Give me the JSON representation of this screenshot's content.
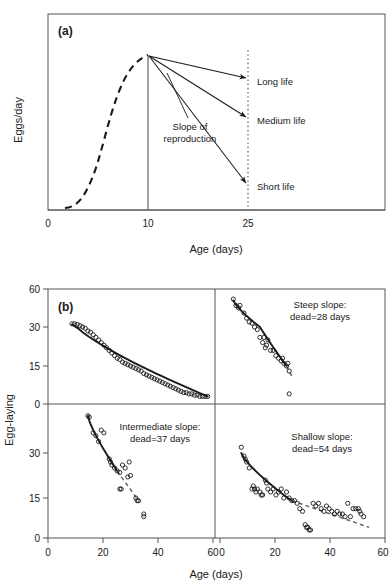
{
  "figure": {
    "panels": [
      {
        "id": "a",
        "letter": "(a)",
        "xlabel": "Age (days)",
        "ylabel": "Eggs/day",
        "xticks": [
          "0",
          "10",
          "25"
        ],
        "annotations": [
          "Long life",
          "Medium life",
          "Short life",
          "Slope of",
          "reproduction"
        ]
      },
      {
        "id": "b",
        "letter": "(b)",
        "xlabel": "Age (days)",
        "ylabel": "Egg-laying",
        "yticks_upper": [
          "60",
          "30",
          "15",
          "0"
        ],
        "yticks_lower": [
          "30",
          "15",
          "0"
        ],
        "xticks_left": [
          "0",
          "20",
          "40",
          "60"
        ],
        "xticks_right": [
          "0",
          "20",
          "40",
          "60"
        ],
        "subpanels": [
          {
            "key": "top_left",
            "line1": "",
            "line2": ""
          },
          {
            "key": "top_right",
            "line1": "Steep slope:",
            "line2": "dead=28 days"
          },
          {
            "key": "bottom_left",
            "line1": "Intermediate slope:",
            "line2": "dead=37 days"
          },
          {
            "key": "bottom_right",
            "line1": "Shallow slope:",
            "line2": "dead=54 days"
          }
        ]
      }
    ]
  },
  "colors": {
    "ink": "#1a1a1a",
    "axis": "#555555",
    "marker_stroke": "#1a1a1a",
    "background": "#ffffff"
  },
  "chart_data": [
    {
      "type": "line",
      "panel": "a",
      "title": "",
      "xlabel": "Age (days)",
      "ylabel": "Eggs/day",
      "xticks": [
        0,
        10,
        25
      ],
      "xlim": [
        0,
        35
      ],
      "ylim": [
        0,
        1
      ],
      "grid": false,
      "legend": "none",
      "series": [
        {
          "name": "rise-to-peak (dashed)",
          "style": "dashed",
          "x": [
            2.0,
            2.8,
            3.6,
            4.4,
            5.2,
            6.0,
            6.8,
            7.6,
            8.4,
            9.2,
            10.0
          ],
          "y": [
            0.02,
            0.05,
            0.1,
            0.18,
            0.3,
            0.45,
            0.62,
            0.78,
            0.9,
            0.97,
            1.0
          ]
        },
        {
          "name": "Long life (slope)",
          "style": "solid-arrow",
          "x": [
            10,
            25
          ],
          "y": [
            1.0,
            0.8
          ]
        },
        {
          "name": "Medium life (slope)",
          "style": "solid-arrow",
          "x": [
            10,
            25
          ],
          "y": [
            1.0,
            0.56
          ]
        },
        {
          "name": "Short life (slope)",
          "style": "solid-arrow",
          "x": [
            10,
            25
          ],
          "y": [
            1.0,
            0.16
          ]
        }
      ],
      "annotations": [
        {
          "text": "Long life",
          "x": 26,
          "y": 0.8
        },
        {
          "text": "Medium life",
          "x": 26,
          "y": 0.56
        },
        {
          "text": "Short life",
          "x": 26,
          "y": 0.16
        },
        {
          "text": "Slope of reproduction",
          "x": 15,
          "y": 0.44
        }
      ],
      "reference_lines": [
        {
          "x": 10,
          "style": "solid"
        },
        {
          "x": 25,
          "style": "dotted"
        }
      ]
    },
    {
      "type": "scatter",
      "panel": "b.top_left",
      "label": "(b)",
      "xlabel": "Age (days)",
      "ylabel": "Egg-laying",
      "xlim": [
        0,
        62
      ],
      "ylim": [
        0,
        60
      ],
      "xticks": [
        0,
        20,
        40,
        60
      ],
      "yticks": [
        0,
        15,
        30,
        60
      ],
      "grid": false,
      "points": [
        [
          9,
          32.5
        ],
        [
          10,
          32.5
        ],
        [
          11,
          32
        ],
        [
          12,
          31
        ],
        [
          13,
          30
        ],
        [
          14,
          29.5
        ],
        [
          15,
          28.5
        ],
        [
          16,
          28
        ],
        [
          17,
          27
        ],
        [
          18,
          26
        ],
        [
          19,
          25
        ],
        [
          20,
          24
        ],
        [
          21,
          23
        ],
        [
          22,
          22
        ],
        [
          23,
          21
        ],
        [
          24,
          20
        ],
        [
          25,
          19
        ],
        [
          26,
          18
        ],
        [
          27,
          17.5
        ],
        [
          28,
          16.5
        ],
        [
          29,
          16
        ],
        [
          30,
          15.5
        ],
        [
          31,
          15
        ],
        [
          32,
          14.5
        ],
        [
          33,
          14
        ],
        [
          34,
          13.5
        ],
        [
          35,
          13
        ],
        [
          36,
          12
        ],
        [
          37,
          11.5
        ],
        [
          38,
          11
        ],
        [
          39,
          10.5
        ],
        [
          40,
          10
        ],
        [
          41,
          9.5
        ],
        [
          42,
          9
        ],
        [
          43,
          8.5
        ],
        [
          44,
          8
        ],
        [
          45,
          7.5
        ],
        [
          46,
          7
        ],
        [
          47,
          6.5
        ],
        [
          48,
          6
        ],
        [
          49,
          5.5
        ],
        [
          50,
          5
        ],
        [
          51,
          4.5
        ],
        [
          52,
          4.5
        ],
        [
          53,
          4
        ],
        [
          54,
          4
        ],
        [
          55,
          3.5
        ],
        [
          56,
          3.5
        ],
        [
          57,
          3
        ],
        [
          58,
          3
        ],
        [
          59,
          3
        ],
        [
          60,
          3
        ]
      ],
      "fit_line": {
        "style": "solid",
        "x": [
          9,
          60
        ],
        "y": [
          32,
          3
        ]
      }
    },
    {
      "type": "scatter",
      "panel": "b.top_right",
      "label": "Steep slope: dead=28 days",
      "xlabel": "Age (days)",
      "ylabel": "Egg-laying",
      "xlim": [
        0,
        62
      ],
      "ylim": [
        0,
        60
      ],
      "xticks": [
        0,
        20,
        40,
        60
      ],
      "yticks": [
        0,
        15,
        30,
        60
      ],
      "grid": false,
      "points": [
        [
          5,
          52
        ],
        [
          6,
          47
        ],
        [
          7,
          45
        ],
        [
          7.5,
          47
        ],
        [
          9,
          41
        ],
        [
          10,
          37
        ],
        [
          11,
          34
        ],
        [
          12,
          33
        ],
        [
          13,
          30
        ],
        [
          14,
          29
        ],
        [
          15,
          26
        ],
        [
          16,
          24
        ],
        [
          16.5,
          26
        ],
        [
          17,
          22
        ],
        [
          17.5,
          23
        ],
        [
          18,
          25
        ],
        [
          19,
          21
        ],
        [
          20,
          21
        ],
        [
          21,
          19
        ],
        [
          22,
          18
        ],
        [
          23,
          17
        ],
        [
          23.5,
          18
        ],
        [
          24,
          16
        ],
        [
          25,
          15
        ],
        [
          25.5,
          16
        ],
        [
          26,
          13
        ],
        [
          26,
          4
        ]
      ],
      "fit_line": {
        "style": "solid",
        "x": [
          5,
          25
        ],
        "y": [
          51,
          15
        ]
      },
      "extrapolation": {
        "style": "dashed",
        "x": [
          25,
          27
        ],
        "y": [
          15,
          11
        ]
      }
    },
    {
      "type": "scatter",
      "panel": "b.bottom_left",
      "label": "Intermediate slope: dead=37 days",
      "xlabel": "Age (days)",
      "ylabel": "Egg-laying",
      "xlim": [
        0,
        62
      ],
      "ylim": [
        0,
        45
      ],
      "xticks": [
        0,
        20,
        40,
        60
      ],
      "yticks": [
        0,
        15,
        30
      ],
      "grid": false,
      "points": [
        [
          15,
          43
        ],
        [
          15.5,
          42.5
        ],
        [
          17,
          37
        ],
        [
          18,
          36
        ],
        [
          19,
          34
        ],
        [
          20,
          38
        ],
        [
          21,
          37
        ],
        [
          23,
          28
        ],
        [
          23.5,
          27
        ],
        [
          24,
          26
        ],
        [
          25,
          25
        ],
        [
          26,
          24
        ],
        [
          27,
          23.5
        ],
        [
          27,
          18
        ],
        [
          27.5,
          18
        ],
        [
          28,
          26
        ],
        [
          29,
          25
        ],
        [
          30,
          22
        ],
        [
          30.5,
          27
        ],
        [
          31,
          22.5
        ],
        [
          33,
          15
        ],
        [
          33.5,
          14
        ],
        [
          34,
          14
        ],
        [
          36,
          9
        ],
        [
          36,
          8
        ]
      ],
      "fit_line": {
        "style": "solid",
        "x": [
          15,
          26
        ],
        "y": [
          43,
          24
        ]
      },
      "extrapolation": {
        "style": "dashed",
        "x": [
          26,
          34
        ],
        "y": [
          24,
          14
        ]
      }
    },
    {
      "type": "scatter",
      "panel": "b.bottom_right",
      "label": "Shallow slope: dead=54 days",
      "xlabel": "Age (days)",
      "ylabel": "Egg-laying",
      "xlim": [
        0,
        62
      ],
      "ylim": [
        0,
        45
      ],
      "xticks": [
        0,
        20,
        40,
        60
      ],
      "yticks": [
        0,
        15,
        30
      ],
      "grid": false,
      "points": [
        [
          8,
          32
        ],
        [
          9,
          29
        ],
        [
          9.5,
          28
        ],
        [
          10,
          27
        ],
        [
          11,
          25
        ],
        [
          12,
          18
        ],
        [
          12.5,
          19
        ],
        [
          13,
          18
        ],
        [
          13.5,
          17
        ],
        [
          14,
          18
        ],
        [
          15,
          17
        ],
        [
          15.5,
          16
        ],
        [
          16,
          16
        ],
        [
          17,
          21
        ],
        [
          17.5,
          20
        ],
        [
          18,
          18
        ],
        [
          19,
          17
        ],
        [
          20,
          18
        ],
        [
          21,
          16
        ],
        [
          22,
          17
        ],
        [
          23,
          18
        ],
        [
          24,
          15
        ],
        [
          25,
          17
        ],
        [
          26,
          15
        ],
        [
          27,
          14
        ],
        [
          28,
          14
        ],
        [
          29,
          13
        ],
        [
          30,
          11
        ],
        [
          31,
          10
        ],
        [
          32,
          5
        ],
        [
          32.5,
          4
        ],
        [
          33,
          4
        ],
        [
          33.5,
          3
        ],
        [
          34,
          3
        ],
        [
          35,
          13
        ],
        [
          36,
          12
        ],
        [
          37,
          13
        ],
        [
          38,
          11
        ],
        [
          39,
          10
        ],
        [
          40,
          12
        ],
        [
          41,
          11
        ],
        [
          42,
          10
        ],
        [
          43,
          9
        ],
        [
          44,
          10
        ],
        [
          45,
          9
        ],
        [
          46,
          9
        ],
        [
          47,
          8
        ],
        [
          48,
          13
        ],
        [
          49,
          8
        ],
        [
          50,
          11
        ],
        [
          51,
          11
        ],
        [
          52,
          11
        ],
        [
          52.5,
          10
        ],
        [
          53,
          9
        ],
        [
          54,
          8
        ]
      ],
      "fit_line": {
        "style": "solid",
        "x": [
          8,
          27
        ],
        "y": [
          30,
          14
        ]
      },
      "extrapolation": {
        "style": "dashed",
        "x": [
          27,
          56
        ],
        "y": [
          14,
          4
        ]
      }
    }
  ]
}
